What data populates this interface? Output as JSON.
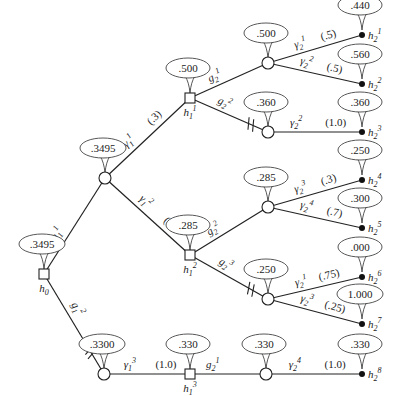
{
  "diagram": {
    "type": "decision-tree",
    "root": {
      "id": "h0",
      "label": "h",
      "sub": "0",
      "value": ".3495",
      "x": 44,
      "y": 274,
      "kind": "decision"
    },
    "nodes": [
      {
        "id": "c1",
        "kind": "chance",
        "x": 105,
        "y": 178,
        "value": ".3495"
      },
      {
        "id": "h1_1",
        "kind": "decision",
        "x": 190,
        "y": 98,
        "value": ".500",
        "label": "h",
        "sub": "1",
        "sup": "1"
      },
      {
        "id": "h1_2",
        "kind": "decision",
        "x": 190,
        "y": 255,
        "value": ".285",
        "label": "h",
        "sub": "1",
        "sup": "2"
      },
      {
        "id": "c4",
        "kind": "chance",
        "x": 104,
        "y": 374,
        "value": ".3300"
      },
      {
        "id": "h1_3",
        "kind": "decision",
        "x": 190,
        "y": 374,
        "value": ".330",
        "label": "h",
        "sub": "1",
        "sup": "3"
      },
      {
        "id": "c2a",
        "kind": "chance",
        "x": 268,
        "y": 63,
        "value": ".500"
      },
      {
        "id": "c2b",
        "kind": "chance",
        "x": 268,
        "y": 132,
        "value": ".360"
      },
      {
        "id": "c2c",
        "kind": "chance",
        "x": 268,
        "y": 207,
        "value": ".285"
      },
      {
        "id": "c2d",
        "kind": "chance",
        "x": 268,
        "y": 299,
        "value": ".250"
      },
      {
        "id": "c2e",
        "kind": "chance",
        "x": 266,
        "y": 374,
        "value": ".330"
      }
    ],
    "terminals": [
      {
        "id": "h2_1",
        "x": 362,
        "y": 35,
        "value": ".440",
        "label": "h",
        "sub": "2",
        "sup": "1"
      },
      {
        "id": "h2_2",
        "x": 362,
        "y": 84,
        "value": ".560",
        "label": "h",
        "sub": "2",
        "sup": "2"
      },
      {
        "id": "h2_3",
        "x": 362,
        "y": 132,
        "value": ".360",
        "label": "h",
        "sub": "2",
        "sup": "3"
      },
      {
        "id": "h2_4",
        "x": 362,
        "y": 180,
        "value": ".250",
        "label": "h",
        "sub": "2",
        "sup": "4"
      },
      {
        "id": "h2_5",
        "x": 362,
        "y": 228,
        "value": ".300",
        "label": "h",
        "sub": "2",
        "sup": "5"
      },
      {
        "id": "h2_6",
        "x": 362,
        "y": 277,
        "value": ".000",
        "label": "h",
        "sub": "2",
        "sup": "6"
      },
      {
        "id": "h2_7",
        "x": 362,
        "y": 324,
        "value": "1.000",
        "label": "h",
        "sub": "2",
        "sup": "7"
      },
      {
        "id": "h2_8",
        "x": 362,
        "y": 374,
        "value": ".330",
        "label": "h",
        "sub": "2",
        "sup": "8"
      }
    ],
    "edges": [
      {
        "from": "h0",
        "to": "c1",
        "label": "g",
        "sub": "1",
        "sup": "1",
        "prob": "",
        "cut": false
      },
      {
        "from": "h0",
        "to": "c4",
        "label": "g",
        "sub": "1",
        "sup": "2",
        "prob": "",
        "cut": true
      },
      {
        "from": "c1",
        "to": "h1_1",
        "label": "γ",
        "sub": "1",
        "sup": "1",
        "prob": "(.3)",
        "cut": false
      },
      {
        "from": "c1",
        "to": "h1_2",
        "label": "γ",
        "sub": "1",
        "sup": "2",
        "prob": "(.7)",
        "cut": false
      },
      {
        "from": "c4",
        "to": "h1_3",
        "label": "γ",
        "sub": "1",
        "sup": "3",
        "prob": "(1.0)",
        "cut": false
      },
      {
        "from": "h1_1",
        "to": "c2a",
        "label": "g",
        "sub": "2",
        "sup": "1",
        "prob": "",
        "cut": false
      },
      {
        "from": "h1_1",
        "to": "c2b",
        "label": "g",
        "sub": "2",
        "sup": "2",
        "prob": "",
        "cut": true
      },
      {
        "from": "h1_2",
        "to": "c2c",
        "label": "g",
        "sub": "2",
        "sup": "2",
        "prob": "",
        "cut": false
      },
      {
        "from": "h1_2",
        "to": "c2d",
        "label": "g",
        "sub": "2",
        "sup": "3",
        "prob": "",
        "cut": true
      },
      {
        "from": "h1_3",
        "to": "c2e",
        "label": "g",
        "sub": "2",
        "sup": "1",
        "prob": "",
        "cut": false
      },
      {
        "from": "c2a",
        "to": "h2_1",
        "label": "γ",
        "sub": "2",
        "sup": "1",
        "prob": "(.5)",
        "cut": false
      },
      {
        "from": "c2a",
        "to": "h2_2",
        "label": "γ",
        "sub": "2",
        "sup": "2",
        "prob": "(.5)",
        "cut": false
      },
      {
        "from": "c2b",
        "to": "h2_3",
        "label": "γ",
        "sub": "2",
        "sup": "2",
        "prob": "(1.0)",
        "cut": false
      },
      {
        "from": "c2c",
        "to": "h2_4",
        "label": "γ",
        "sub": "2",
        "sup": "3",
        "prob": "(.3)",
        "cut": false
      },
      {
        "from": "c2c",
        "to": "h2_5",
        "label": "γ",
        "sub": "2",
        "sup": "4",
        "prob": "(.7)",
        "cut": false
      },
      {
        "from": "c2d",
        "to": "h2_6",
        "label": "γ",
        "sub": "2",
        "sup": "1",
        "prob": "(.75)",
        "cut": false
      },
      {
        "from": "c2d",
        "to": "h2_7",
        "label": "γ",
        "sub": "2",
        "sup": "3",
        "prob": "(.25)",
        "cut": false
      },
      {
        "from": "c2e",
        "to": "h2_8",
        "label": "γ",
        "sub": "2",
        "sup": "4",
        "prob": "(1.0)",
        "cut": false
      }
    ]
  }
}
